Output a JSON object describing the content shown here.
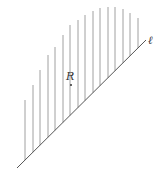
{
  "diagram": {
    "type": "half-plane-region",
    "line": {
      "label": "ℓ",
      "x1": 17,
      "y1": 168,
      "x2": 146,
      "y2": 40,
      "color": "#555555"
    },
    "region": {
      "label": "R",
      "label_x": 66,
      "label_y": 80,
      "point_x": 71,
      "point_y": 85
    },
    "hatching": {
      "color": "#888888",
      "lines": [
        {
          "x": 25,
          "top": 100
        },
        {
          "x": 33,
          "top": 85
        },
        {
          "x": 40,
          "top": 70
        },
        {
          "x": 48,
          "top": 55
        },
        {
          "x": 55,
          "top": 47
        },
        {
          "x": 63,
          "top": 35
        },
        {
          "x": 70,
          "top": 25
        },
        {
          "x": 78,
          "top": 20
        },
        {
          "x": 85,
          "top": 15
        },
        {
          "x": 93,
          "top": 11
        },
        {
          "x": 100,
          "top": 8
        },
        {
          "x": 108,
          "top": 7
        },
        {
          "x": 115,
          "top": 7
        },
        {
          "x": 123,
          "top": 9
        },
        {
          "x": 130,
          "top": 13
        },
        {
          "x": 138,
          "top": 18
        }
      ]
    }
  }
}
